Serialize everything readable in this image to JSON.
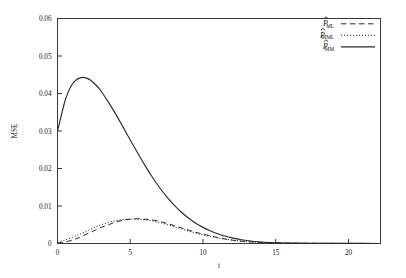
{
  "chart_data": {
    "type": "line",
    "title": "",
    "xlabel": "t",
    "ylabel": "MSE",
    "xlim": [
      0,
      22.2
    ],
    "ylim": [
      0,
      0.06
    ],
    "grid": false,
    "legend_position": "top-right",
    "xticks": [
      0,
      5,
      10,
      15,
      20
    ],
    "xtick_labels": [
      "0",
      "5",
      "10",
      "15",
      "20"
    ],
    "yticks": [
      0,
      0.01,
      0.02,
      0.03,
      0.04,
      0.05,
      0.06
    ],
    "ytick_labels": [
      "0",
      "0.01",
      "0.02",
      "0.03",
      "0.04",
      "0.05",
      "0.06"
    ],
    "series": [
      {
        "name": "P_ML",
        "label_base": "P",
        "label_sub": "ML",
        "style": "dashed",
        "color": "#2b2b2b",
        "x": [
          0,
          0.5,
          1,
          1.5,
          2,
          2.5,
          3,
          3.5,
          4,
          4.5,
          5,
          5.5,
          6,
          6.5,
          7,
          7.5,
          8,
          8.5,
          9,
          9.5,
          10,
          11,
          12,
          13,
          14,
          15,
          16,
          18,
          20,
          22
        ],
        "y": [
          0.0002,
          0.0004,
          0.0009,
          0.0016,
          0.0025,
          0.0034,
          0.0043,
          0.005,
          0.0057,
          0.0062,
          0.0065,
          0.0066,
          0.0065,
          0.0063,
          0.0059,
          0.0054,
          0.0048,
          0.0042,
          0.0036,
          0.003,
          0.0025,
          0.0016,
          0.0009,
          0.0005,
          0.0003,
          0.0002,
          0.0001,
          4e-05,
          2e-05,
          1e-05
        ]
      },
      {
        "name": "P_MML",
        "label_base": "P",
        "label_sub": "MML",
        "style": "dotted",
        "color": "#2b2b2b",
        "x": [
          0,
          0.5,
          1,
          1.5,
          2,
          2.5,
          3,
          3.5,
          4,
          4.5,
          5,
          5.5,
          6,
          6.5,
          7,
          7.5,
          8,
          8.5,
          9,
          9.5,
          10,
          11,
          12,
          13,
          14,
          15,
          16,
          18,
          20,
          22
        ],
        "y": [
          0.0004,
          0.0009,
          0.0016,
          0.0024,
          0.0033,
          0.0042,
          0.005,
          0.0056,
          0.0061,
          0.0064,
          0.0065,
          0.0065,
          0.0063,
          0.006,
          0.0056,
          0.0051,
          0.0045,
          0.0039,
          0.0033,
          0.0028,
          0.0023,
          0.0015,
          0.0009,
          0.0005,
          0.0003,
          0.0002,
          0.0001,
          4e-05,
          2e-05,
          1e-05
        ]
      },
      {
        "name": "P_MM",
        "label_base": "P",
        "label_sub": "MM",
        "style": "solid",
        "color": "#2b2b2b",
        "x": [
          0,
          0.25,
          0.5,
          0.75,
          1,
          1.25,
          1.5,
          1.75,
          2,
          2.25,
          2.5,
          2.75,
          3,
          3.5,
          4,
          4.5,
          5,
          5.5,
          6,
          6.5,
          7,
          7.5,
          8,
          8.5,
          9,
          9.5,
          10,
          10.5,
          11,
          11.5,
          12,
          12.5,
          13,
          14,
          15,
          16,
          18,
          20,
          22
        ],
        "y": [
          0.03,
          0.034,
          0.0378,
          0.0405,
          0.0424,
          0.0435,
          0.0441,
          0.0443,
          0.0441,
          0.0436,
          0.0428,
          0.0418,
          0.0406,
          0.0377,
          0.0345,
          0.0311,
          0.0276,
          0.0242,
          0.0209,
          0.0178,
          0.015,
          0.0125,
          0.0103,
          0.0084,
          0.0068,
          0.0054,
          0.0043,
          0.0034,
          0.0026,
          0.002,
          0.0015,
          0.0011,
          0.0008,
          0.0004,
          0.0002,
          0.0001,
          4e-05,
          2e-05,
          1e-05
        ]
      }
    ]
  },
  "legend": {
    "entries": [
      {
        "base": "P",
        "sub": "ML",
        "style": "dashed"
      },
      {
        "base": "P",
        "sub": "MML",
        "style": "dotted"
      },
      {
        "base": "P",
        "sub": "MM",
        "style": "solid"
      }
    ]
  }
}
